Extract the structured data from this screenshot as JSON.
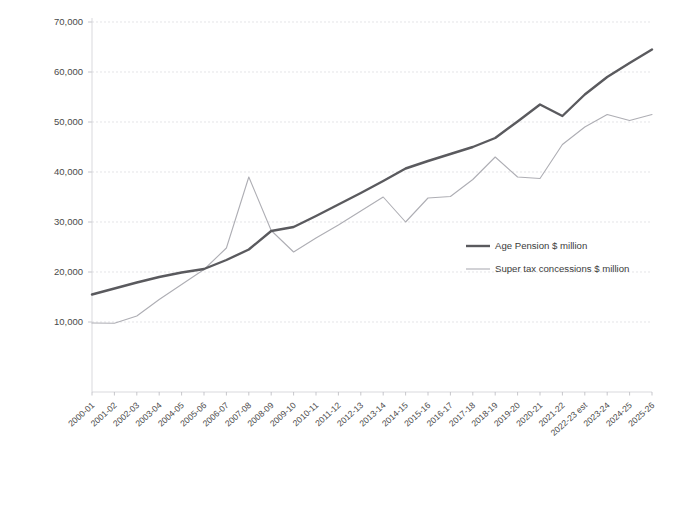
{
  "chart_data": {
    "type": "line",
    "title": "",
    "subtitle": "",
    "xlabel": "",
    "ylabel": "",
    "ylim": [
      0,
      70000
    ],
    "yticks": [
      10000,
      20000,
      30000,
      40000,
      50000,
      60000,
      70000
    ],
    "ytick_labels": [
      "10,000",
      "20,000",
      "30,000",
      "40,000",
      "50,000",
      "60,000",
      "70,000"
    ],
    "grid": true,
    "legend_position": "center-right",
    "categories": [
      "2000-01",
      "2001-02",
      "2002-03",
      "2003-04",
      "2004-05",
      "2005-06",
      "2006-07",
      "2007-08",
      "2008-09",
      "2009-10",
      "2010-11",
      "2011-12",
      "2012-13",
      "2013-14",
      "2014-15",
      "2015-16",
      "2016-17",
      "2017-18",
      "2018-19",
      "2019-20",
      "2020-21",
      "2021-22",
      "2022-23 est",
      "2023-24",
      "2024-25",
      "2025-26"
    ],
    "series": [
      {
        "name": "Age Pension $ million",
        "color": "#5a5a5e",
        "width": "thick",
        "values": [
          15500,
          16700,
          17900,
          19000,
          19900,
          20600,
          22400,
          24500,
          28200,
          29000,
          31200,
          33500,
          35800,
          38200,
          40700,
          42200,
          43600,
          45000,
          46800,
          50100,
          53500,
          51200,
          55500,
          59000,
          61800,
          64500
        ]
      },
      {
        "name": "Super tax concessions $ million",
        "color": "#aeaeb4",
        "width": "thin",
        "values": [
          9800,
          9750,
          11200,
          14500,
          17500,
          20500,
          24800,
          39000,
          28300,
          24000,
          26800,
          29400,
          32200,
          35000,
          30000,
          34800,
          35100,
          38500,
          43000,
          39000,
          38700,
          45500,
          49000,
          51500,
          50300,
          51500
        ]
      }
    ]
  },
  "legend": {
    "entries": [
      {
        "label": "Age Pension $ million"
      },
      {
        "label": "Super tax concessions $ million"
      }
    ]
  }
}
